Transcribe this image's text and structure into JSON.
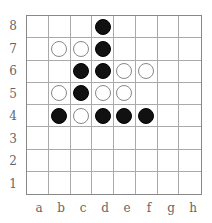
{
  "board": {
    "files": [
      "a",
      "b",
      "c",
      "d",
      "e",
      "f",
      "g",
      "h"
    ],
    "ranks": [
      "8",
      "7",
      "6",
      "5",
      "4",
      "3",
      "2",
      "1"
    ],
    "stones": [
      {
        "square": "d8",
        "color": "black"
      },
      {
        "square": "b7",
        "color": "white"
      },
      {
        "square": "c7",
        "color": "white"
      },
      {
        "square": "d7",
        "color": "black"
      },
      {
        "square": "c6",
        "color": "black"
      },
      {
        "square": "d6",
        "color": "black"
      },
      {
        "square": "e6",
        "color": "white"
      },
      {
        "square": "f6",
        "color": "white"
      },
      {
        "square": "b5",
        "color": "white"
      },
      {
        "square": "c5",
        "color": "black"
      },
      {
        "square": "d5",
        "color": "white"
      },
      {
        "square": "e5",
        "color": "white"
      },
      {
        "square": "b4",
        "color": "black"
      },
      {
        "square": "c4",
        "color": "white"
      },
      {
        "square": "d4",
        "color": "black"
      },
      {
        "square": "e4",
        "color": "black"
      },
      {
        "square": "f4",
        "color": "black"
      }
    ]
  }
}
